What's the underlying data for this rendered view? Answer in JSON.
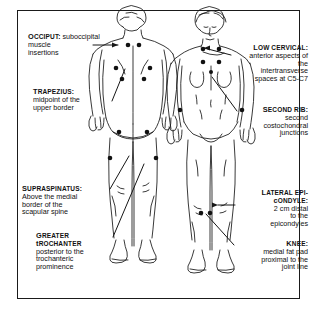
{
  "diagram": {
    "views": {
      "posterior": "posterior view figure",
      "anterior": "anterior view figure"
    },
    "ink_color": "#111111",
    "background_color": "#ffffff"
  },
  "callouts": [
    {
      "id": "occiput",
      "term": "Occiput:",
      "description": "suboccipital muscle insertions",
      "lines": [
        "suboccipital",
        "muscle",
        "insertions"
      ],
      "align": "left",
      "side": "posterior"
    },
    {
      "id": "trapezius",
      "term": "Trapezius:",
      "description": "midpoint of the upper border",
      "lines": [
        "midpoint of the",
        "upper border"
      ],
      "align": "left",
      "side": "posterior"
    },
    {
      "id": "supraspinatus",
      "term": "Supraspinatus:",
      "description": "Above the medial border of the scapular spine",
      "lines": [
        "Above the medial",
        "border of the",
        "scapular spine"
      ],
      "align": "left",
      "side": "posterior"
    },
    {
      "id": "greater-trochanter",
      "term": "Greater trochanter",
      "term_lines": [
        "Greater",
        "trochanter"
      ],
      "description": "posterior to the trochanteric prominence",
      "lines": [
        "posterior to the",
        "trochanteric",
        "prominence"
      ],
      "align": "left",
      "side": "posterior"
    },
    {
      "id": "low-cervical",
      "term": "Low cervical:",
      "description": "anterior aspects of the intertransverse spaces at C5-C7",
      "lines": [
        "anterior aspects of",
        "the",
        "intertransverse",
        "spaces at C5-C7"
      ],
      "align": "right",
      "side": "anterior"
    },
    {
      "id": "second-rib",
      "term": "Second rib:",
      "description": "second costochondral junctions",
      "lines": [
        "second",
        "costochondral",
        "junctions"
      ],
      "align": "right",
      "side": "anterior"
    },
    {
      "id": "lateral-epicondyle",
      "term": "Lateral epi-condyle:",
      "term_lines": [
        "Lateral epi-",
        "condyle:"
      ],
      "description": "2 cm distal to the epicondyles",
      "lines": [
        "2 cm distal",
        "to the",
        "epicondyles"
      ],
      "align": "right",
      "side": "anterior"
    },
    {
      "id": "knee",
      "term": "Knee:",
      "description": "medial fat pad proximal to the joint line",
      "lines": [
        "medial fat pad",
        "proximal to the",
        "joint line"
      ],
      "align": "right",
      "side": "anterior"
    }
  ]
}
